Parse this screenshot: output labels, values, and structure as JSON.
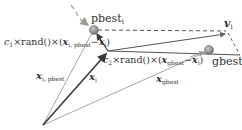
{
  "diagram": {
    "colors": {
      "light_line": "#a8a8a8",
      "dark_line": "#3a3a3a",
      "dashed_line": "#555555",
      "point_fill": "#8c8c8c",
      "text": "#333333"
    },
    "labels": {
      "pbest": "pbest",
      "pbest_sub": "i",
      "gbest": "gbest",
      "v_i": "v",
      "v_i_sub": "i",
      "x_i": "x",
      "x_i_sub": "i",
      "x_i_pbest": "x",
      "x_i_pbest_sub": "i, pbest",
      "x_gbest": "x",
      "x_gbest_sub": "gbest",
      "c1_term_prefix": "c",
      "c1_sub": "1",
      "c1_term_mid": "×rand()×(",
      "c1_term_x": "x",
      "c1_term_x_sub": "i, pbest",
      "c1_term_minus": "−",
      "c1_term_xi": "x",
      "c1_term_xi_sub": "i",
      "c1_term_close": ")",
      "c2_term_prefix": "c",
      "c2_sub": "2",
      "c2_term_mid": "×rand()×(",
      "c2_term_x": "x",
      "c2_term_x_sub": "gbest",
      "c2_term_minus": "−",
      "c2_term_xi": "x",
      "c2_term_xi_sub": "i",
      "c2_term_close": ")"
    },
    "nodes": [
      {
        "name": "origin",
        "x": 43,
        "y": 125
      },
      {
        "name": "pbest_i",
        "x": 94,
        "y": 30
      },
      {
        "name": "x_i",
        "x": 108,
        "y": 51
      },
      {
        "name": "gbest",
        "x": 209,
        "y": 50
      },
      {
        "name": "v_i_tip",
        "x": 226,
        "y": 33
      }
    ]
  }
}
